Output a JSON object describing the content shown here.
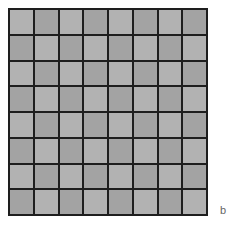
{
  "figure": {
    "label": "b",
    "grid": {
      "rows": 8,
      "cols": 8,
      "pattern": "checkerboard",
      "colors": {
        "light": "#b2b2b2",
        "dark": "#a3a3a3",
        "line": "#1e1e1e"
      },
      "cells": [
        [
          "L",
          "D",
          "L",
          "D",
          "L",
          "D",
          "L",
          "D"
        ],
        [
          "D",
          "L",
          "D",
          "L",
          "D",
          "L",
          "D",
          "L"
        ],
        [
          "L",
          "D",
          "L",
          "D",
          "L",
          "D",
          "L",
          "D"
        ],
        [
          "D",
          "L",
          "D",
          "L",
          "D",
          "L",
          "D",
          "L"
        ],
        [
          "L",
          "D",
          "L",
          "D",
          "L",
          "D",
          "L",
          "D"
        ],
        [
          "D",
          "L",
          "D",
          "L",
          "D",
          "L",
          "D",
          "L"
        ],
        [
          "L",
          "D",
          "L",
          "D",
          "L",
          "D",
          "L",
          "D"
        ],
        [
          "D",
          "L",
          "D",
          "L",
          "D",
          "L",
          "D",
          "L"
        ]
      ]
    }
  }
}
